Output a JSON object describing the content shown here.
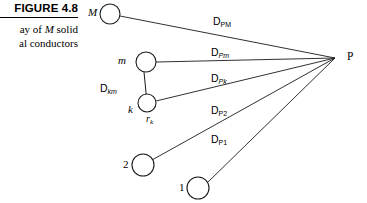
{
  "figure": {
    "label": "FIGURE 4.8",
    "caption_line1_prefix": "ay of ",
    "caption_line1_italic": "M",
    "caption_line1_suffix": " solid",
    "caption_line2": "al conductors"
  },
  "diagram": {
    "observation_point": {
      "name": "point-p",
      "label": "P",
      "x": 335,
      "y": 58
    },
    "conductors": [
      {
        "id": "M",
        "label": "M",
        "label_style": "italic",
        "cx": 110,
        "cy": 14,
        "r": 10
      },
      {
        "id": "m",
        "label": "m",
        "label_style": "italic",
        "cx": 146,
        "cy": 62,
        "r": 10
      },
      {
        "id": "k",
        "label": "k",
        "label_style": "italic",
        "cx": 147,
        "cy": 103,
        "r": 9
      },
      {
        "id": "2",
        "label": "2",
        "label_style": "plain",
        "cx": 143,
        "cy": 165,
        "r": 11
      },
      {
        "id": "1",
        "label": "1",
        "label_style": "plain",
        "cx": 198,
        "cy": 188,
        "r": 11
      }
    ],
    "distance_rays": [
      {
        "id": "D_PM",
        "base": "D",
        "sub": "PM",
        "from": "M",
        "label_x": 213,
        "label_y": 15
      },
      {
        "id": "D_Pm",
        "base": "D",
        "sub": "Pm",
        "from": "m",
        "label_x": 211,
        "label_y": 46
      },
      {
        "id": "D_Pk",
        "base": "D",
        "sub": "Pk",
        "from": "k",
        "label_x": 211,
        "label_y": 72
      },
      {
        "id": "D_P2",
        "base": "D",
        "sub": "P2",
        "from": "2",
        "label_x": 211,
        "label_y": 104
      },
      {
        "id": "D_P1",
        "base": "D",
        "sub": "P1",
        "from": "1",
        "label_x": 211,
        "label_y": 133
      }
    ],
    "inter_conductor_link": {
      "id": "D_km",
      "base": "D",
      "sub": "km",
      "from": "m",
      "to": "k",
      "label_x": 100,
      "label_y": 82
    },
    "radius_marker": {
      "id": "r_k",
      "base": "r",
      "sub": "k",
      "of": "k",
      "label_x": 146,
      "label_y": 113
    }
  },
  "colors": {
    "ink": "#1a1a1a",
    "background": "#ffffff"
  }
}
